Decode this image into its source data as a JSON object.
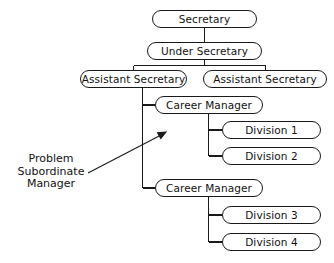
{
  "diagram": {
    "type": "org-chart",
    "colors": {
      "line": "#1a1a1a",
      "box_border": "#1a1a1a",
      "box_fill": "#ffffff",
      "text": "#111111",
      "background": "#ffffff"
    },
    "nodes": [
      {
        "id": "secretary",
        "label": "Secretary",
        "x": 152,
        "y": 10,
        "w": 105,
        "h": 18
      },
      {
        "id": "under-secretary",
        "label": "Under Secretary",
        "x": 147,
        "y": 42,
        "w": 115,
        "h": 18
      },
      {
        "id": "assistant-secretary-left",
        "label": "Assistant Secretary",
        "x": 80,
        "y": 70,
        "w": 107,
        "h": 18
      },
      {
        "id": "assistant-secretary-right",
        "label": "Assistant Secretary",
        "x": 203,
        "y": 70,
        "w": 124,
        "h": 18
      },
      {
        "id": "career-manager-1",
        "label": "Career Manager",
        "x": 155,
        "y": 96,
        "w": 108,
        "h": 18
      },
      {
        "id": "division-1",
        "label": "Division 1",
        "x": 222,
        "y": 121,
        "w": 99,
        "h": 18
      },
      {
        "id": "division-2",
        "label": "Division 2",
        "x": 222,
        "y": 147,
        "w": 99,
        "h": 18
      },
      {
        "id": "career-manager-2",
        "label": "Career Manager",
        "x": 155,
        "y": 179,
        "w": 108,
        "h": 18
      },
      {
        "id": "division-3",
        "label": "Division 3",
        "x": 222,
        "y": 206,
        "w": 99,
        "h": 18
      },
      {
        "id": "division-4",
        "label": "Division 4",
        "x": 222,
        "y": 233,
        "w": 99,
        "h": 18
      }
    ],
    "annotation": {
      "id": "problem-subordinate-manager",
      "lines": [
        "Problem",
        "Subordinate",
        "Manager"
      ],
      "x": 8,
      "y": 153,
      "width": 86,
      "arrow": {
        "from_x": 88,
        "from_y": 173,
        "to_x": 166,
        "to_y": 132
      }
    }
  }
}
